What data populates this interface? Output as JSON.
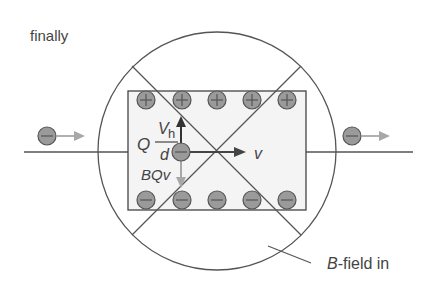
{
  "title": "finally",
  "labels": {
    "force_electric_q": "Q",
    "force_electric_num": "V",
    "force_electric_sub": "h",
    "force_electric_den": "d",
    "force_magnetic": "BQv",
    "velocity": "v",
    "field_B": "B",
    "field_rest": "-field in"
  },
  "symbols": {
    "positive": "+",
    "negative": "−"
  },
  "colors": {
    "charge_fill": "#9a9a9a",
    "line": "#555555",
    "rect_fill": "#f4f4f4",
    "arrow_dark": "#444444",
    "arrow_light": "#a8a8a8"
  }
}
